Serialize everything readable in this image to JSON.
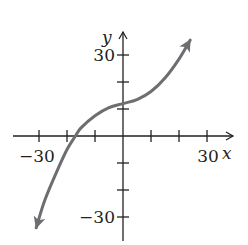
{
  "chart_data": {
    "type": "line",
    "title": "",
    "xlabel": "x",
    "ylabel": "y",
    "xlim": [
      -40,
      40
    ],
    "ylim": [
      -37,
      37
    ],
    "x_tick_step": 10,
    "y_tick_step": 10,
    "x_tick_labels": [
      {
        "value": -30,
        "label": "−30"
      },
      {
        "value": 30,
        "label": "30"
      }
    ],
    "y_tick_labels": [
      {
        "value": 30,
        "label": "30"
      },
      {
        "value": -30,
        "label": "−30"
      }
    ],
    "grid": false,
    "series": [
      {
        "name": "curve",
        "color": "#6d6e71",
        "arrows": "both ends",
        "x": [
          -31,
          -28,
          -24,
          -20,
          -17,
          -15,
          -10,
          -5,
          0,
          5,
          10,
          15,
          20,
          24
        ],
        "y": [
          -34,
          -24,
          -14,
          -5,
          0,
          3,
          7.5,
          10.5,
          12,
          13.5,
          16.5,
          21.5,
          28.5,
          35.5
        ]
      }
    ],
    "colors": {
      "axis": "#231f20",
      "curve": "#6d6e71"
    }
  }
}
